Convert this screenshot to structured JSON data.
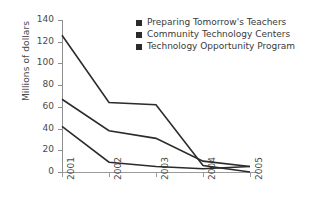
{
  "chart_data": {
    "type": "line",
    "title": "",
    "xlabel": "",
    "ylabel": "Millions of dollars",
    "categories": [
      "2001",
      "2002",
      "2003",
      "2004",
      "2005"
    ],
    "ylim": [
      0,
      140
    ],
    "yticks": [
      0,
      20,
      40,
      60,
      80,
      100,
      120,
      140
    ],
    "grid": false,
    "legend_position": "top-right",
    "series": [
      {
        "name": "Preparing Tomorrow's Teachers",
        "color": "#2b2b2b",
        "values": [
          126,
          64,
          62,
          6,
          0
        ]
      },
      {
        "name": "Community Technology Centers",
        "color": "#2b2b2b",
        "values": [
          67,
          38,
          31,
          10,
          5
        ]
      },
      {
        "name": "Technology Opportunity Program",
        "color": "#2b2b2b",
        "values": [
          42,
          9,
          5,
          3,
          5
        ]
      }
    ]
  },
  "axis": {
    "line_color": "#9a9a9a",
    "tick_labels_y": [
      "0",
      "20",
      "40",
      "60",
      "80",
      "100",
      "120",
      "140"
    ],
    "tick_labels_x": [
      "2001",
      "2002",
      "2003",
      "2004",
      "2005"
    ]
  },
  "legend": {
    "items": [
      {
        "label": "Preparing Tomorrow's Teachers"
      },
      {
        "label": "Community Technology Centers"
      },
      {
        "label": "Technology Opportunity Program"
      }
    ]
  }
}
